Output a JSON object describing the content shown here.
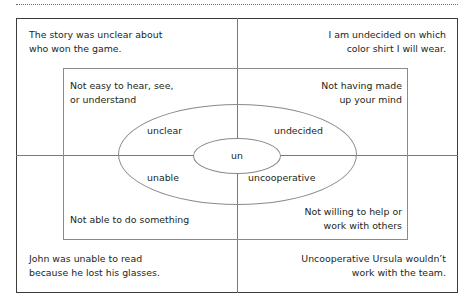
{
  "diagram": {
    "title_root_word": "un",
    "top_rule": "dotted-divider",
    "quadrants": {
      "top_left": {
        "example_sentence": "The story was unclear about\nwho won the game.",
        "definition": "Not easy to hear, see,\nor understand",
        "word": "unclear"
      },
      "top_right": {
        "example_sentence": "I am undecided on which\ncolor shirt I will wear.",
        "definition": "Not having made\nup your mind",
        "word": "undecided"
      },
      "bottom_left": {
        "example_sentence": "John was unable to read\nbecause he lost his glasses.",
        "definition": "Not able to do something",
        "word": "unable"
      },
      "bottom_right": {
        "example_sentence": "Uncooperative Ursula wouldn’t\nwork with the team.",
        "definition": "Not willing to help or\nwork with others",
        "word": "uncooperative"
      }
    },
    "colors": {
      "text": "#231f20",
      "outer_border": "#3b3b3b",
      "inner_border": "#8a8a8a",
      "axis": "#7a7a7a",
      "dotted_rule": "#6f6f6f",
      "background": "#ffffff"
    }
  }
}
